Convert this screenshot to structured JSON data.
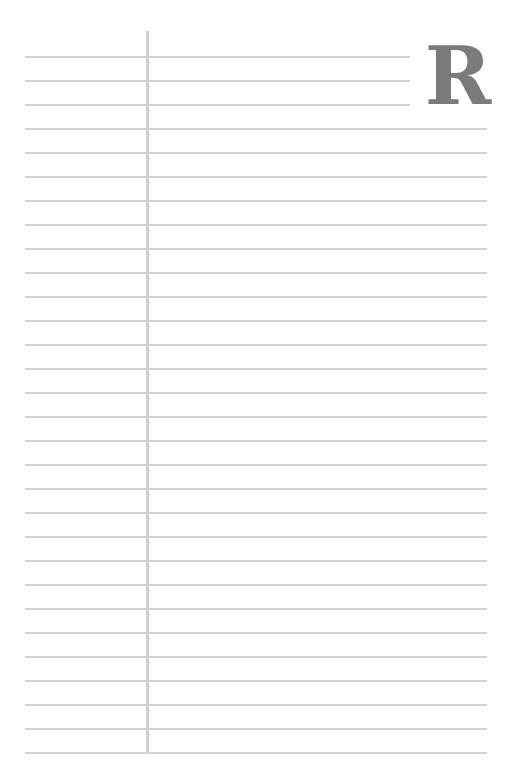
{
  "page": {
    "type": "lined-notepaper",
    "background_color": "#ffffff",
    "line_color": "#d2d2d2",
    "margin_line_color": "#d0d0d0"
  },
  "monogram": {
    "letter": "R",
    "color": "#7b7b7b"
  },
  "lines": {
    "count": 30,
    "first_y": 56,
    "spacing": 24,
    "left_x": 25,
    "right_x": 487,
    "short_lines_count": 3,
    "short_lines_right_x": 410
  },
  "margin": {
    "x": 146,
    "top_y": 31,
    "bottom_y": 753
  }
}
